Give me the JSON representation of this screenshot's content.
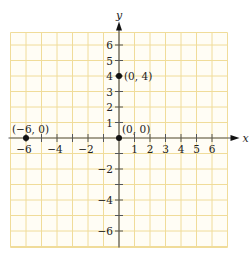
{
  "chart_data": {
    "type": "scatter",
    "title": "",
    "xlabel": "x",
    "ylabel": "y",
    "xlim": [
      -7,
      7
    ],
    "ylim": [
      -7,
      7
    ],
    "grid": true,
    "x_ticks": [
      -6,
      -5,
      -4,
      -3,
      -2,
      -1,
      1,
      2,
      3,
      4,
      5,
      6
    ],
    "x_tick_labels": [
      {
        "value": -6,
        "label": "−6"
      },
      {
        "value": -4,
        "label": "−4"
      },
      {
        "value": -2,
        "label": "−2"
      },
      {
        "value": 1,
        "label": "1"
      },
      {
        "value": 2,
        "label": "2"
      },
      {
        "value": 3,
        "label": "3"
      },
      {
        "value": 4,
        "label": "4"
      },
      {
        "value": 5,
        "label": "5"
      },
      {
        "value": 6,
        "label": "6"
      }
    ],
    "y_ticks": [
      -6,
      -5,
      -4,
      -3,
      -2,
      -1,
      1,
      2,
      3,
      4,
      5,
      6
    ],
    "y_tick_labels": [
      {
        "value": 6,
        "label": "6"
      },
      {
        "value": 5,
        "label": "5"
      },
      {
        "value": 4,
        "label": "4"
      },
      {
        "value": 3,
        "label": "3"
      },
      {
        "value": 2,
        "label": "2"
      },
      {
        "value": 1,
        "label": "1"
      },
      {
        "value": -2,
        "label": "−2"
      },
      {
        "value": -4,
        "label": "−4"
      },
      {
        "value": -6,
        "label": "−6"
      }
    ],
    "points": [
      {
        "x": -6,
        "y": 0,
        "label": "(−6, 0)"
      },
      {
        "x": 0,
        "y": 0,
        "label": "(0, 0)"
      },
      {
        "x": 0,
        "y": 4,
        "label": "(0, 4)"
      }
    ]
  },
  "colors": {
    "grid": "#f0dc9a",
    "axis": "#555555",
    "point": "#111111"
  }
}
